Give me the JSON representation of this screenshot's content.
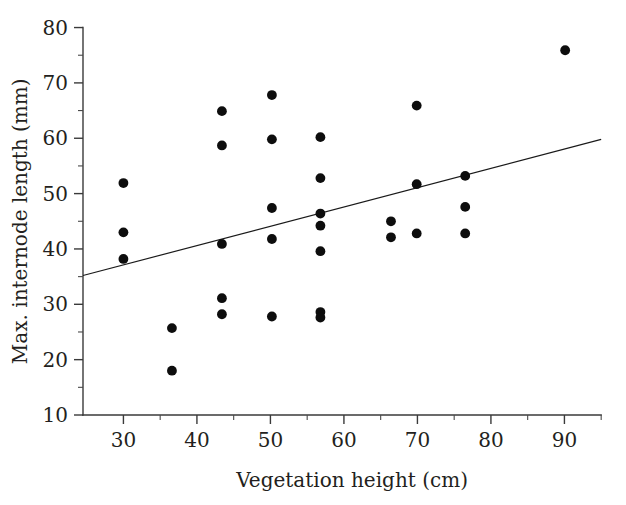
{
  "chart_data": {
    "type": "scatter",
    "title": "",
    "xlabel": "Vegetation height (cm)",
    "ylabel": "Max. internode length (mm)",
    "xlim": [
      24.5,
      95
    ],
    "ylim": [
      10,
      80
    ],
    "xticks": [
      30,
      40,
      50,
      60,
      70,
      80,
      90
    ],
    "yticks": [
      10,
      20,
      30,
      40,
      50,
      60,
      70,
      80
    ],
    "xtick_labels": [
      "30",
      "40",
      "50",
      "60",
      "70",
      "80",
      "90"
    ],
    "ytick_labels": [
      "10",
      "20",
      "30",
      "40",
      "50",
      "60",
      "70",
      "80"
    ],
    "x_minor_ticks": [
      35,
      45,
      55,
      65,
      75,
      85
    ],
    "y_minor_ticks": [
      15,
      25,
      35,
      45,
      55,
      65,
      75
    ],
    "grid": false,
    "legend": "none",
    "marker": "filled-circle",
    "marker_color": "#0d0d0d",
    "points": [
      {
        "x": 30.0,
        "y": 51.9
      },
      {
        "x": 30.0,
        "y": 43.0
      },
      {
        "x": 30.0,
        "y": 38.2
      },
      {
        "x": 36.6,
        "y": 25.7
      },
      {
        "x": 36.6,
        "y": 18.0
      },
      {
        "x": 43.4,
        "y": 64.9
      },
      {
        "x": 43.4,
        "y": 58.7
      },
      {
        "x": 43.4,
        "y": 40.9
      },
      {
        "x": 43.4,
        "y": 31.1
      },
      {
        "x": 43.4,
        "y": 28.2
      },
      {
        "x": 50.2,
        "y": 67.8
      },
      {
        "x": 50.2,
        "y": 59.8
      },
      {
        "x": 50.2,
        "y": 47.4
      },
      {
        "x": 50.2,
        "y": 41.8
      },
      {
        "x": 50.2,
        "y": 27.8
      },
      {
        "x": 56.8,
        "y": 60.2
      },
      {
        "x": 56.8,
        "y": 52.8
      },
      {
        "x": 56.8,
        "y": 46.4
      },
      {
        "x": 56.8,
        "y": 44.2
      },
      {
        "x": 56.8,
        "y": 39.6
      },
      {
        "x": 56.8,
        "y": 28.6
      },
      {
        "x": 56.8,
        "y": 27.6
      },
      {
        "x": 66.4,
        "y": 45.0
      },
      {
        "x": 66.4,
        "y": 42.1
      },
      {
        "x": 69.9,
        "y": 65.9
      },
      {
        "x": 69.9,
        "y": 51.7
      },
      {
        "x": 69.9,
        "y": 42.8
      },
      {
        "x": 76.5,
        "y": 53.2
      },
      {
        "x": 76.5,
        "y": 47.6
      },
      {
        "x": 76.5,
        "y": 42.8
      },
      {
        "x": 90.1,
        "y": 75.9
      }
    ],
    "fit_line": {
      "x_start": 24.5,
      "y_start": 35.2,
      "x_end": 95.0,
      "y_end": 59.8,
      "color": "#1a1a1a"
    }
  }
}
